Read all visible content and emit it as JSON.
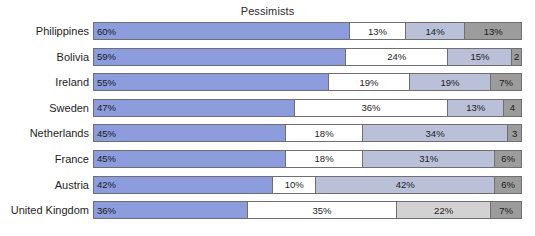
{
  "chart_data": {
    "type": "bar",
    "orientation": "horizontal",
    "stacked": true,
    "normalized_percent": true,
    "title": "Pessimists",
    "xlabel": "",
    "ylabel": "",
    "xlim": [
      0,
      100
    ],
    "grid": false,
    "legend": null,
    "categories": [
      "Philippines",
      "Bolivia",
      "Ireland",
      "Sweden",
      "Netherlands",
      "France",
      "Austria",
      "United Kingdom"
    ],
    "series": [
      {
        "name": "segment-1",
        "color": "#8c9cdc",
        "values": [
          60,
          59,
          55,
          47,
          45,
          45,
          42,
          36
        ]
      },
      {
        "name": "segment-2",
        "color": "#ffffff",
        "values": [
          13,
          24,
          19,
          36,
          18,
          18,
          10,
          35
        ]
      },
      {
        "name": "segment-3",
        "color": "#b9c0d8",
        "values": [
          14,
          15,
          19,
          13,
          34,
          31,
          42,
          22
        ]
      },
      {
        "name": "segment-4",
        "color": "#9c9c9c",
        "values": [
          13,
          2,
          7,
          4,
          3,
          6,
          6,
          7
        ]
      }
    ],
    "rows": [
      {
        "label": "Philippines",
        "segments": [
          {
            "value": 60,
            "text": "60%",
            "color": "#8c9cdc"
          },
          {
            "value": 13,
            "text": "13%",
            "color": "#ffffff"
          },
          {
            "value": 14,
            "text": "14%",
            "color": "#b9c0d8"
          },
          {
            "value": 13,
            "text": "13%",
            "color": "#9c9c9c"
          }
        ]
      },
      {
        "label": "Bolivia",
        "segments": [
          {
            "value": 59,
            "text": "59%",
            "color": "#8c9cdc"
          },
          {
            "value": 24,
            "text": "24%",
            "color": "#ffffff"
          },
          {
            "value": 15,
            "text": "15%",
            "color": "#b9c0d8"
          },
          {
            "value": 2,
            "text": "2",
            "color": "#9c9c9c"
          }
        ]
      },
      {
        "label": "Ireland",
        "segments": [
          {
            "value": 55,
            "text": "55%",
            "color": "#8c9cdc"
          },
          {
            "value": 19,
            "text": "19%",
            "color": "#ffffff"
          },
          {
            "value": 19,
            "text": "19%",
            "color": "#b9c0d8"
          },
          {
            "value": 7,
            "text": "7%",
            "color": "#9c9c9c"
          }
        ]
      },
      {
        "label": "Sweden",
        "segments": [
          {
            "value": 47,
            "text": "47%",
            "color": "#8c9cdc"
          },
          {
            "value": 36,
            "text": "36%",
            "color": "#ffffff"
          },
          {
            "value": 13,
            "text": "13%",
            "color": "#b9c0d8"
          },
          {
            "value": 4,
            "text": "4",
            "color": "#9c9c9c"
          }
        ]
      },
      {
        "label": "Netherlands",
        "segments": [
          {
            "value": 45,
            "text": "45%",
            "color": "#8c9cdc"
          },
          {
            "value": 18,
            "text": "18%",
            "color": "#ffffff"
          },
          {
            "value": 34,
            "text": "34%",
            "color": "#b9c0d8"
          },
          {
            "value": 3,
            "text": "3",
            "color": "#9c9c9c"
          }
        ]
      },
      {
        "label": "France",
        "segments": [
          {
            "value": 45,
            "text": "45%",
            "color": "#8c9cdc"
          },
          {
            "value": 18,
            "text": "18%",
            "color": "#ffffff"
          },
          {
            "value": 31,
            "text": "31%",
            "color": "#b9c0d8"
          },
          {
            "value": 6,
            "text": "6%",
            "color": "#9c9c9c"
          }
        ]
      },
      {
        "label": "Austria",
        "segments": [
          {
            "value": 42,
            "text": "42%",
            "color": "#8c9cdc"
          },
          {
            "value": 10,
            "text": "10%",
            "color": "#ffffff"
          },
          {
            "value": 42,
            "text": "42%",
            "color": "#b9c0d8"
          },
          {
            "value": 6,
            "text": "6%",
            "color": "#9c9c9c"
          }
        ]
      },
      {
        "label": "United Kingdom",
        "segments": [
          {
            "value": 36,
            "text": "36%",
            "color": "#8c9cdc"
          },
          {
            "value": 35,
            "text": "35%",
            "color": "#ffffff"
          },
          {
            "value": 22,
            "text": "22%",
            "color": "#d2d2d2"
          },
          {
            "value": 7,
            "text": "7%",
            "color": "#9c9c9c"
          }
        ]
      }
    ]
  }
}
